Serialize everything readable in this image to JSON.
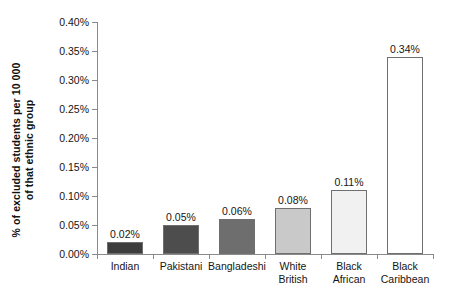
{
  "chart_data": {
    "type": "bar",
    "title": "",
    "subtitle": "",
    "xlabel": "",
    "ylabel": "% of excluded students per 10 000\nof that ethnic group",
    "ylabel_line1": "% of excluded students per 10 000",
    "ylabel_line2": "of that ethnic group",
    "categories": [
      "Indian",
      "Pakistani",
      "Bangladeshi",
      "White British",
      "Black African",
      "Black Caribbean"
    ],
    "category_lines": [
      [
        "Indian"
      ],
      [
        "Pakistani"
      ],
      [
        "Bangladeshi"
      ],
      [
        "White",
        "British"
      ],
      [
        "Black",
        "African"
      ],
      [
        "Black",
        "Caribbean"
      ]
    ],
    "values": [
      0.02,
      0.05,
      0.06,
      0.08,
      0.11,
      0.34
    ],
    "value_labels": [
      "0.02%",
      "0.05%",
      "0.06%",
      "0.08%",
      "0.11%",
      "0.34%"
    ],
    "bar_colors": [
      "#3d3d3d",
      "#4d4d4d",
      "#6e6e6e",
      "#c9c9c9",
      "#f1f1f1",
      "#ffffff"
    ],
    "bar_border_color": "#6f6f6f",
    "ylim": [
      0.0,
      0.4
    ],
    "ytick_values": [
      0.0,
      0.05,
      0.1,
      0.15,
      0.2,
      0.25,
      0.3,
      0.35,
      0.4
    ],
    "ytick_labels": [
      "0.00%",
      "0.05%",
      "0.10%",
      "0.15%",
      "0.20%",
      "0.25%",
      "0.30%",
      "0.35%",
      "0.40%"
    ],
    "grid": false,
    "legend": false,
    "legend_position": "none",
    "axis_color": "#8a8a8a"
  }
}
